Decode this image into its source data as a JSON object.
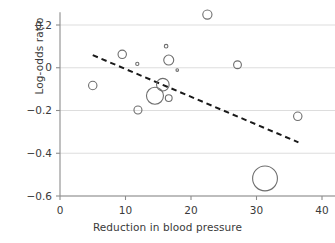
{
  "chart_data": {
    "type": "scatter",
    "title": "",
    "xlabel": "Reduction in blood pressure",
    "ylabel": "Log-odds ratio",
    "xlim": [
      0,
      40
    ],
    "ylim": [
      -0.6,
      0.26
    ],
    "xticks": [
      0,
      10,
      20,
      30,
      40
    ],
    "xtick_labels": [
      "0",
      "10",
      "20",
      "30",
      "40"
    ],
    "yticks": [
      0.2,
      0,
      -0.2,
      -0.4,
      -0.6
    ],
    "ytick_labels": [
      "0.2",
      "0",
      "−0.2",
      "−0.4",
      "−0.6"
    ],
    "grid": "horizontal",
    "legend": "none",
    "marker_style": "open-circle",
    "marker_color": "#6e6e6e",
    "points": [
      {
        "x": 5.0,
        "y": -0.083,
        "size": 4.2
      },
      {
        "x": 9.5,
        "y": 0.063,
        "size": 4.2
      },
      {
        "x": 11.8,
        "y": 0.018,
        "size": 1.6
      },
      {
        "x": 11.9,
        "y": -0.198,
        "size": 4.0
      },
      {
        "x": 14.5,
        "y": -0.131,
        "size": 8.5
      },
      {
        "x": 15.7,
        "y": -0.079,
        "size": 6.3
      },
      {
        "x": 16.2,
        "y": 0.101,
        "size": 1.8
      },
      {
        "x": 16.6,
        "y": -0.142,
        "size": 3.4
      },
      {
        "x": 16.6,
        "y": 0.036,
        "size": 5.0
      },
      {
        "x": 17.9,
        "y": -0.011,
        "size": 1.3
      },
      {
        "x": 22.5,
        "y": 0.249,
        "size": 4.6
      },
      {
        "x": 27.1,
        "y": 0.014,
        "size": 3.9
      },
      {
        "x": 31.3,
        "y": -0.518,
        "size": 12.4
      },
      {
        "x": 36.3,
        "y": -0.227,
        "size": 4.2
      }
    ],
    "trend_line": {
      "style": "dashed",
      "color": "#1a1a1a",
      "x_start": 5.0,
      "y_start": 0.059,
      "x_end": 36.4,
      "y_end": -0.349
    }
  },
  "axes": {
    "y_title": "Log-odds ratio",
    "x_title": "Reduction in blood pressure"
  }
}
